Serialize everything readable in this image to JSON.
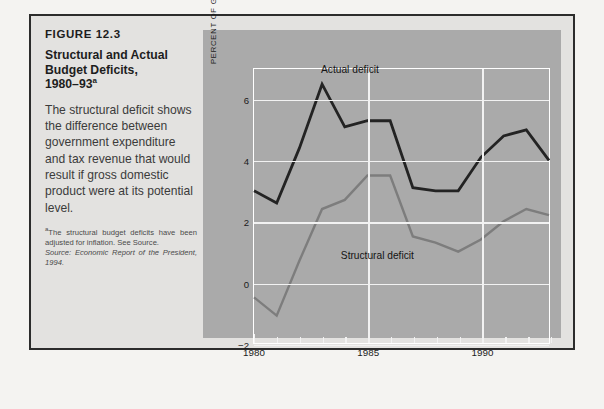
{
  "figure": {
    "number": "FIGURE 12.3",
    "title_line1": "Structural and Actual",
    "title_line2": "Budget Deficits,",
    "title_line3": "1980–93",
    "title_superscript": "a",
    "caption": "The structural deficit shows the difference between government expenditure and tax revenue that would result if gross domestic product were at its potential level.",
    "footnote_marker": "a",
    "footnote": "The structural budget deficits have been adjusted for inflation. See Source.",
    "source_label": "Source:",
    "source_text": "Economic Report of the President, 1994."
  },
  "colors": {
    "page_background": "#f4f3f1",
    "frame_background": "#e3e2e0",
    "frame_border": "#2c2c2c",
    "chart_panel": "#aaaaaa",
    "gridline": "#f2f2f2",
    "actual_line": "#232323",
    "structural_line": "#7d7d7d"
  },
  "chart_data": {
    "type": "line",
    "title": "Structural and Actual Budget Deficits, 1980–93",
    "xlabel": "",
    "ylabel": "PERCENT OF GDP",
    "grid": true,
    "legend": "inline-annotations",
    "xlim": [
      1980,
      1993
    ],
    "ylim": [
      -2,
      7
    ],
    "ytick_labels": [
      "6",
      "4",
      "2",
      "0",
      "−2"
    ],
    "yticks": [
      6,
      4,
      2,
      0,
      -2
    ],
    "xtick_labels": [
      "1980",
      "1985",
      "1990"
    ],
    "xticks_major": [
      1980,
      1985,
      1990
    ],
    "x": [
      1980,
      1981,
      1982,
      1983,
      1984,
      1985,
      1986,
      1987,
      1988,
      1989,
      1990,
      1991,
      1992,
      1993
    ],
    "series": [
      {
        "name": "Actual deficit",
        "color": "#232323",
        "values": [
          3.0,
          2.6,
          4.4,
          6.5,
          5.1,
          5.3,
          5.3,
          3.1,
          3.0,
          3.0,
          4.1,
          4.8,
          5.0,
          4.0
        ],
        "annotation": {
          "label": "Actual deficit",
          "x": 1984.2,
          "y": 7.0
        }
      },
      {
        "name": "Structural deficit",
        "color": "#7d7d7d",
        "values": [
          -0.5,
          -1.1,
          0.7,
          2.4,
          2.7,
          3.5,
          3.5,
          1.5,
          1.3,
          1.0,
          1.4,
          2.0,
          2.4,
          2.2
        ],
        "annotation": {
          "label": "Structural deficit",
          "x": 1985.4,
          "y": 0.95
        }
      }
    ]
  }
}
